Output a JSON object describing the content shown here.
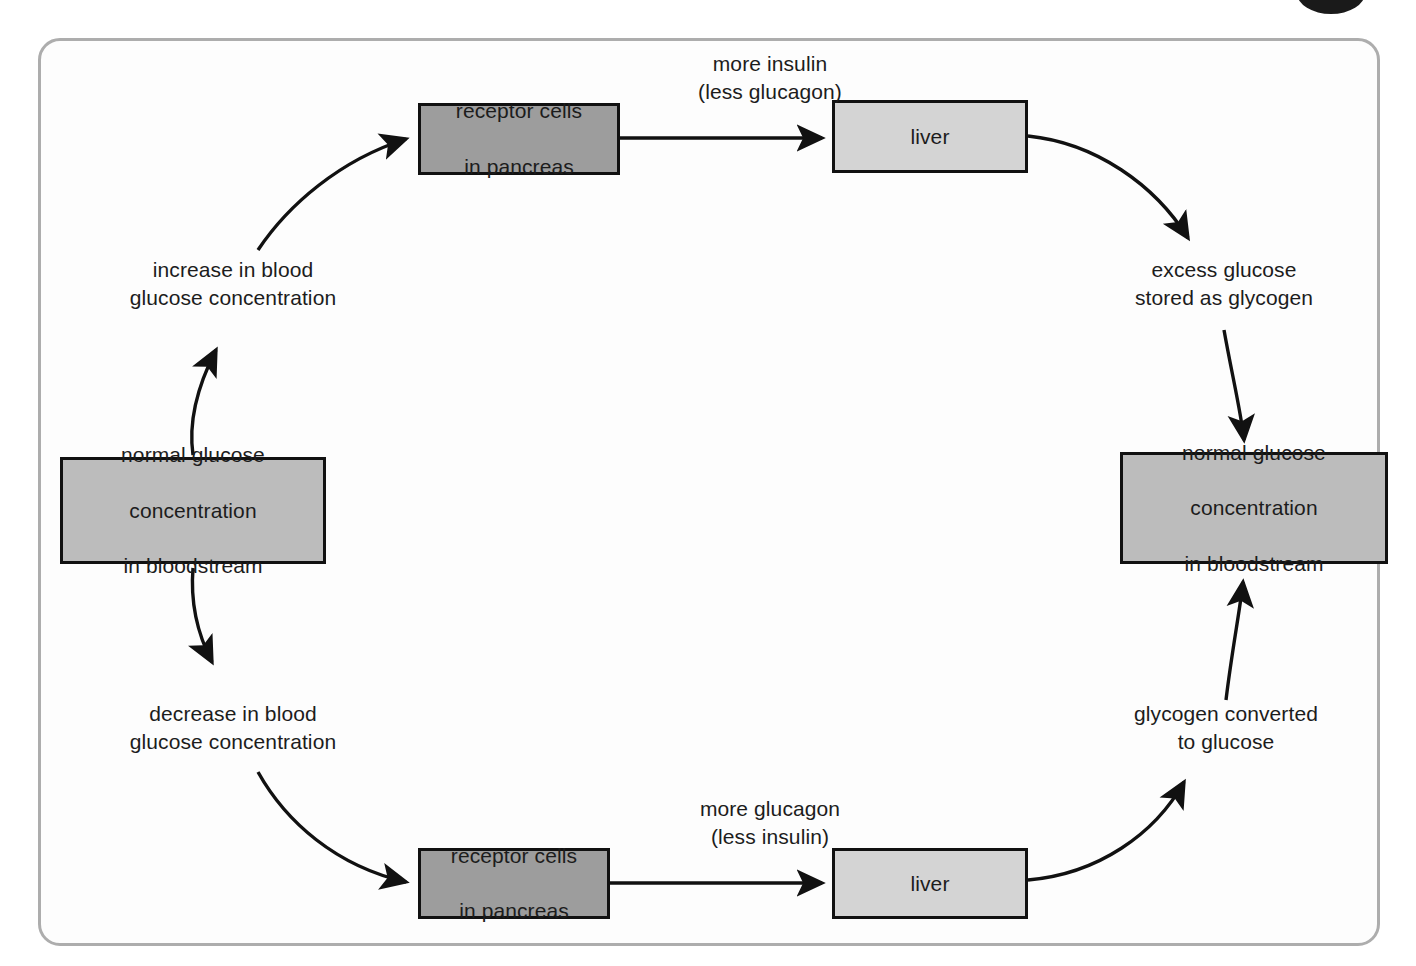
{
  "diagram": {
    "frame": {
      "border_color": "#adadad",
      "background": "#fdfdfd"
    },
    "corner_marker": {
      "name": "page-corner-dot",
      "color": "#1a1a1a"
    },
    "palette": {
      "node_dark": "#9d9d9d",
      "node_mid": "#bcbcbc",
      "node_light": "#d4d4d4",
      "stroke": "#111111",
      "text": "#1c1c1c"
    },
    "nodes": {
      "pancreas_top": "receptor cells\nin pancreas",
      "pancreas_top_line1": "receptor cells",
      "pancreas_top_line2": "in pancreas",
      "liver_top": "liver",
      "normal_left_line1": "normal glucose",
      "normal_left_line2": "concentration",
      "normal_left_line3": "in bloodstream",
      "normal_right_line1": "normal glucose",
      "normal_right_line2": "concentration",
      "normal_right_line3": "in bloodstream",
      "pancreas_bottom_line1": "receptor cells",
      "pancreas_bottom_line2": "in pancreas",
      "liver_bottom": "liver"
    },
    "edge_labels": {
      "more_insulin": "more insulin\n(less glucagon)",
      "increase_blood_glucose": "increase in blood\nglucose concentration",
      "excess_glucose": "excess glucose\nstored as glycogen",
      "decrease_blood_glucose": "decrease in blood\nglucose concentration",
      "glycogen_converted": "glycogen converted\nto glucose",
      "more_glucagon": "more glucagon\n(less insulin)"
    }
  }
}
